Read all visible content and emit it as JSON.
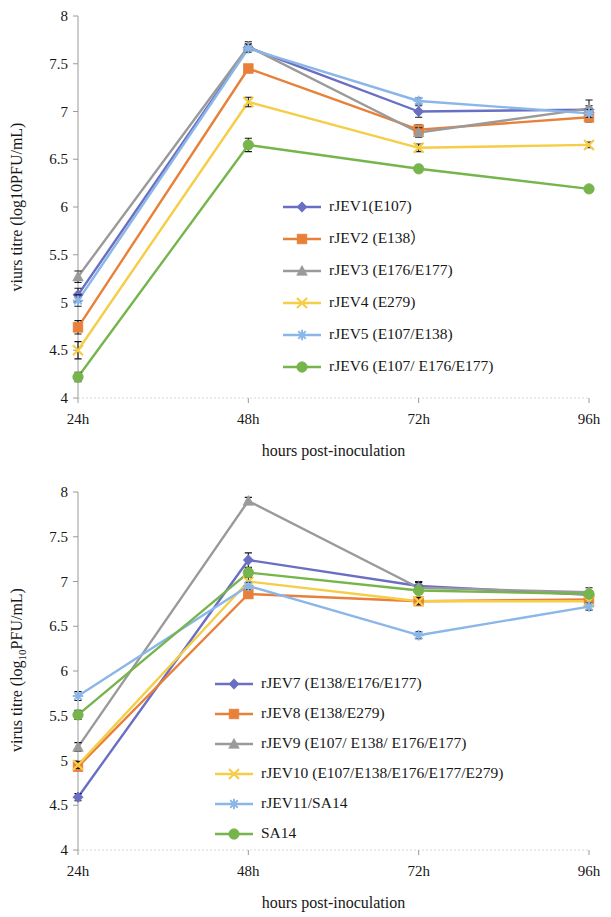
{
  "figure": {
    "background": "#ffffff",
    "panels": [
      "top",
      "bottom"
    ]
  },
  "panel_top": {
    "y_axis_title": "viurs titre (log10PFU/mL)",
    "x_axis_title": "hours post-inoculation",
    "y_ticks": [
      "4",
      "4.5",
      "5",
      "5.5",
      "6",
      "6.5",
      "7",
      "7.5",
      "8"
    ],
    "x_ticks": [
      "24h",
      "48h",
      "72h",
      "96h"
    ],
    "legend": [
      {
        "label": "rJEV1(E107)",
        "color": "#6a6fc4",
        "marker": "diamond"
      },
      {
        "label": "rJEV2 (E138）",
        "color": "#e8803a",
        "marker": "square"
      },
      {
        "label": "rJEV3 (E176/E177)",
        "color": "#9a9a9a",
        "marker": "triangle"
      },
      {
        "label": "rJEV4 (E279)",
        "color": "#f6cd46",
        "marker": "cross"
      },
      {
        "label": "rJEV5 (E107/E138)",
        "color": "#8ab6e8",
        "marker": "asterisk"
      },
      {
        "label": "rJEV6 (E107/ E176/E177)",
        "color": "#76b54b",
        "marker": "circle"
      }
    ]
  },
  "panel_bottom": {
    "y_axis_title_pre": "virus titre (log",
    "y_axis_title_sub": "10",
    "y_axis_title_post": "PFU/mL)",
    "x_axis_title": "hours post-inoculation",
    "y_ticks": [
      "4",
      "4.5",
      "5",
      "5.5",
      "6",
      "6.5",
      "7",
      "7.5",
      "8"
    ],
    "x_ticks": [
      "24h",
      "48h",
      "72h",
      "96h"
    ],
    "legend": [
      {
        "label": "rJEV7 (E138/E176/E177)",
        "color": "#6a6fc4",
        "marker": "diamond"
      },
      {
        "label": "rJEV8 (E138/E279)",
        "color": "#e8803a",
        "marker": "square"
      },
      {
        "label": "rJEV9 (E107/ E138/ E176/E177)",
        "color": "#9a9a9a",
        "marker": "triangle"
      },
      {
        "label": "rJEV10 (E107/E138/E176/E177/E279)",
        "color": "#f6cd46",
        "marker": "cross"
      },
      {
        "label": "rJEV11/SA14",
        "color": "#8ab6e8",
        "marker": "asterisk"
      },
      {
        "label": "SA14",
        "color": "#76b54b",
        "marker": "circle"
      }
    ]
  },
  "chart_data": [
    {
      "type": "line",
      "title": "",
      "xlabel": "hours post-inoculation",
      "ylabel": "viurs titre (log10PFU/mL)",
      "categories": [
        "24h",
        "48h",
        "72h",
        "96h"
      ],
      "ylim": [
        4,
        8
      ],
      "ytick_step": 0.5,
      "grid": false,
      "legend_position": "inside-center",
      "series": [
        {
          "name": "rJEV1(E107)",
          "color": "#6a6fc4",
          "marker": "diamond",
          "values": [
            5.08,
            7.67,
            7.0,
            7.02
          ],
          "errors": [
            0.07,
            0.04,
            0.06,
            0.04
          ]
        },
        {
          "name": "rJEV2 (E138）",
          "color": "#e8803a",
          "marker": "square",
          "values": [
            4.74,
            7.45,
            6.81,
            6.94
          ],
          "errors": [
            0.07,
            0.03,
            0.05,
            0.05
          ]
        },
        {
          "name": "rJEV3 (E176/E177)",
          "color": "#9a9a9a",
          "marker": "triangle",
          "values": [
            5.27,
            7.68,
            6.78,
            7.03
          ],
          "errors": [
            0.06,
            0.05,
            0.05,
            0.09
          ]
        },
        {
          "name": "rJEV4 (E279)",
          "color": "#f6cd46",
          "marker": "cross",
          "values": [
            4.5,
            7.1,
            6.62,
            6.65
          ],
          "errors": [
            0.09,
            0.05,
            0.04,
            0.03
          ]
        },
        {
          "name": "rJEV5 (E107/E138)",
          "color": "#8ab6e8",
          "marker": "asterisk",
          "values": [
            5.02,
            7.66,
            7.11,
            6.98
          ],
          "errors": [
            0.06,
            0.04,
            0.03,
            0.04
          ]
        },
        {
          "name": "rJEV6 (E107/ E176/E177)",
          "color": "#76b54b",
          "marker": "circle",
          "values": [
            4.22,
            6.65,
            6.4,
            6.19
          ],
          "errors": [
            0.05,
            0.07,
            0.03,
            0.03
          ]
        }
      ]
    },
    {
      "type": "line",
      "title": "",
      "xlabel": "hours post-inoculation",
      "ylabel": "virus titre (log10PFU/mL)",
      "categories": [
        "24h",
        "48h",
        "72h",
        "96h"
      ],
      "ylim": [
        4,
        8
      ],
      "ytick_step": 0.5,
      "grid": false,
      "legend_position": "inside-center",
      "series": [
        {
          "name": "rJEV7 (E138/E176/E177)",
          "color": "#6a6fc4",
          "marker": "diamond",
          "values": [
            4.59,
            7.24,
            6.95,
            6.85
          ],
          "errors": [
            0.04,
            0.08,
            0.05,
            0.04
          ]
        },
        {
          "name": "rJEV8 (E138/E279)",
          "color": "#e8803a",
          "marker": "square",
          "values": [
            4.93,
            6.86,
            6.78,
            6.8
          ],
          "errors": [
            0.04,
            0.04,
            0.04,
            0.04
          ]
        },
        {
          "name": "rJEV9 (E107/ E138/ E176/E177)",
          "color": "#9a9a9a",
          "marker": "triangle",
          "values": [
            5.15,
            7.9,
            6.93,
            6.88
          ],
          "errors": [
            0.05,
            0.04,
            0.06,
            0.05
          ]
        },
        {
          "name": "rJEV10 (E107/E138/E176/E177/E279)",
          "color": "#f6cd46",
          "marker": "cross",
          "values": [
            4.95,
            7.0,
            6.78,
            6.78
          ],
          "errors": [
            0.04,
            0.05,
            0.04,
            0.04
          ]
        },
        {
          "name": "rJEV11/SA14",
          "color": "#8ab6e8",
          "marker": "asterisk",
          "values": [
            5.72,
            6.95,
            6.4,
            6.72
          ],
          "errors": [
            0.05,
            0.04,
            0.04,
            0.04
          ]
        },
        {
          "name": "SA14",
          "color": "#76b54b",
          "marker": "circle",
          "values": [
            5.51,
            7.1,
            6.9,
            6.86
          ],
          "errors": [
            0.05,
            0.05,
            0.04,
            0.04
          ]
        }
      ]
    }
  ]
}
